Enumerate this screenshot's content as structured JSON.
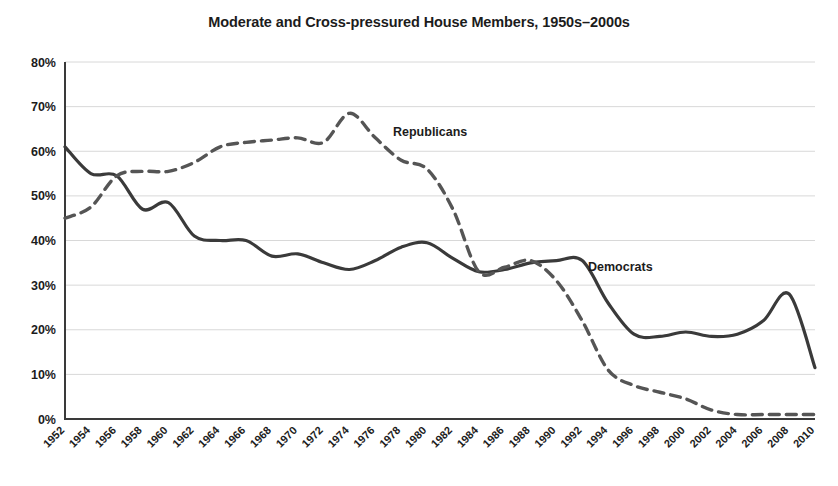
{
  "chart_data": {
    "type": "line",
    "title": "Moderate and Cross-pressured House Members, 1950s–2000s",
    "xlabel": "",
    "ylabel": "",
    "ylim": [
      0,
      80
    ],
    "ytick_labels": [
      "0%",
      "10%",
      "20%",
      "30%",
      "40%",
      "50%",
      "60%",
      "70%",
      "80%"
    ],
    "ytick_values": [
      0,
      10,
      20,
      30,
      40,
      50,
      60,
      70,
      80
    ],
    "grid": true,
    "legend_position": "inline-annotation",
    "x": [
      1952,
      1954,
      1956,
      1958,
      1960,
      1962,
      1964,
      1966,
      1968,
      1970,
      1972,
      1974,
      1976,
      1978,
      1980,
      1982,
      1984,
      1986,
      1988,
      1990,
      1992,
      1994,
      1996,
      1998,
      2000,
      2002,
      2004,
      2006,
      2008,
      2010
    ],
    "xtick_labels": [
      "1952",
      "1954",
      "1956",
      "1958",
      "1960",
      "1962",
      "1964",
      "1966",
      "1968",
      "1970",
      "1972",
      "1974",
      "1976",
      "1978",
      "1980",
      "1982",
      "1984",
      "1986",
      "1988",
      "1990",
      "1992",
      "1994",
      "1996",
      "1998",
      "2000",
      "2002",
      "2004",
      "2006",
      "2008",
      "2010"
    ],
    "series": [
      {
        "name": "Democrats",
        "style": "solid",
        "color": "#3a3a3a",
        "label_annotation": "Democrats",
        "values": [
          61,
          55,
          54.5,
          47,
          48.5,
          41,
          40,
          40,
          36.5,
          37,
          35,
          33.5,
          35.5,
          38.5,
          39.5,
          36,
          33,
          33.5,
          35,
          35.5,
          35.5,
          26,
          19,
          18.5,
          19.5,
          18.5,
          19,
          22,
          28,
          11.5
        ]
      },
      {
        "name": "Republicans",
        "style": "dashed",
        "color": "#555555",
        "label_annotation": "Republicans",
        "values": [
          45,
          47.5,
          54.5,
          55.5,
          55.5,
          57.5,
          61,
          62,
          62.5,
          63,
          62,
          68.5,
          63,
          58,
          56,
          47,
          33,
          34,
          35.5,
          31,
          22,
          11,
          7.5,
          6,
          4.5,
          2,
          1,
          1,
          1,
          1
        ]
      }
    ]
  },
  "annotations": {
    "republicans_label": "Republicans",
    "democrats_label": "Democrats"
  },
  "colors": {
    "democrats": "#3a3a3a",
    "republicans": "#555555",
    "gridline": "#d8d8d8",
    "axis": "#3a3a3a",
    "background": "#ffffff",
    "text": "#1c1c1c"
  }
}
